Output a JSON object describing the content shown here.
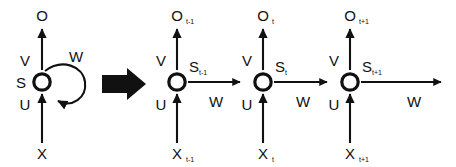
{
  "figure": {
    "background_color": "#ffffff",
    "ink_color": "#111111",
    "weight_labels": {
      "input_weight": "U",
      "output_weight": "V",
      "recurrent_weight": "W"
    },
    "transition_arrow": "right-arrow-glyph"
  },
  "folded": {
    "name": "folded-rnn",
    "output_label": "O",
    "state_label": "S",
    "input_label": "X",
    "weight_v": "V",
    "weight_u": "U",
    "weight_w": "W"
  },
  "unfolded": {
    "name": "unfolded-rnn",
    "steps": [
      {
        "id": "t-minus-1",
        "output_label": "O",
        "output_sub": "t-1",
        "state_label": "S",
        "state_sub": "t-1",
        "input_label": "X",
        "input_sub": "t-1",
        "weight_v": "V",
        "weight_u": "U",
        "weight_w": "W"
      },
      {
        "id": "t",
        "output_label": "O",
        "output_sub": "t",
        "state_label": "S",
        "state_sub": "t",
        "input_label": "X",
        "input_sub": "t",
        "weight_v": "V",
        "weight_u": "U",
        "weight_w": "W"
      },
      {
        "id": "t-plus-1",
        "output_label": "O",
        "output_sub": "t+1",
        "state_label": "S",
        "state_sub": "t+1",
        "input_label": "X",
        "input_sub": "t+1",
        "weight_v": "V",
        "weight_u": "U",
        "weight_w": "W"
      }
    ]
  }
}
